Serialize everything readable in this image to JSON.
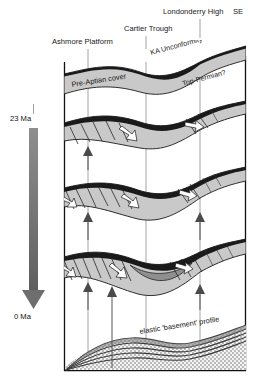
{
  "figure": {
    "orientation_label": "SE",
    "background_color": "#ffffff",
    "strata_color": "#c9c9c9",
    "basement_color": "#8f8f8f"
  },
  "top_labels": [
    {
      "id": "ashmore-platform",
      "text": "Ashmore Platform",
      "x": 52,
      "y": 44,
      "tick_x": 88,
      "tick_y1": 48,
      "tick_y2": 62
    },
    {
      "id": "cartier-trough",
      "text": "Cartier Trough",
      "x": 124,
      "y": 31,
      "tick_x": 146,
      "tick_y1": 35,
      "tick_y2": 48
    },
    {
      "id": "londonderry-high",
      "text": "Londonderry High",
      "x": 163,
      "y": 14,
      "tick_x": 200,
      "tick_y1": 18,
      "tick_y2": 36
    },
    {
      "id": "se-direction",
      "text": "SE",
      "x": 233,
      "y": 14
    }
  ],
  "horizon_labels": [
    {
      "id": "ka-unconformity",
      "text": "KA Unconformity",
      "x": 151,
      "y": 52,
      "rotation": -14
    },
    {
      "id": "top-permian",
      "text": "Top-Permian?",
      "x": 184,
      "y": 83,
      "rotation": -14
    },
    {
      "id": "pre-aptian-cover",
      "text": "Pre-Aptian cover",
      "x": 55,
      "y": 80,
      "rotation": -9
    },
    {
      "id": "elastic-basement-profile",
      "text": "elastic 'basement' profile",
      "x": 138,
      "y": 334,
      "rotation": -9
    }
  ],
  "time_axis": {
    "id": "time-axis",
    "top_label": "23 Ma",
    "bottom_label": "0 Ma",
    "top_label_x": 12,
    "top_label_y": 121,
    "bottom_label_x": 15,
    "bottom_label_y": 318,
    "arrow_x": 34,
    "arrow_top_y": 126,
    "arrow_bottom_y": 310,
    "direction": "downward"
  },
  "panels": [
    {
      "id": "panel-1",
      "name": "pre-aptian-cover-panel",
      "label": "Pre-Aptian cover",
      "y_top": 55,
      "y_bottom": 110
    },
    {
      "id": "panel-2",
      "name": "early-rift-panel",
      "y_top": 110,
      "y_bottom": 175
    },
    {
      "id": "panel-3",
      "name": "mid-rift-panel",
      "y_top": 175,
      "y_bottom": 240
    },
    {
      "id": "panel-4",
      "name": "late-rift-panel",
      "y_top": 240,
      "y_bottom": 310
    },
    {
      "id": "panel-5",
      "name": "basement-profile-panel",
      "y_top": 310,
      "y_bottom": 372
    }
  ],
  "guide_lines_x": [
    88,
    146,
    200
  ],
  "frame": {
    "left": 64,
    "right": 246,
    "top": 58,
    "bottom": 371
  },
  "uplift_arrows": [
    {
      "panel": "panel-2",
      "x": 88,
      "y_base": 168,
      "y_tip": 150
    },
    {
      "panel": "panel-3",
      "x": 88,
      "y_base": 238,
      "y_tip": 212
    },
    {
      "panel": "panel-3",
      "x": 200,
      "y_base": 238,
      "y_tip": 212
    },
    {
      "panel": "panel-4",
      "x": 88,
      "y_base": 308,
      "y_tip": 282
    },
    {
      "panel": "panel-4",
      "x": 200,
      "y_base": 308,
      "y_tip": 284
    },
    {
      "panel": "panel-5",
      "x": 112,
      "y_base": 368,
      "y_tip": 286
    }
  ],
  "basement_curves": 5,
  "stipple": {
    "pattern": "dotted",
    "dot_color": "#595959",
    "fill": "#f2f2f2"
  }
}
